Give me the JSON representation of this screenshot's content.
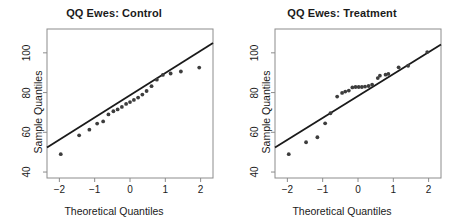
{
  "figure": {
    "background": "#ffffff",
    "foreground": "#333333",
    "frame_color": "#8c8c8c",
    "point_color": "#3d3d3d",
    "line_color": "#1a1a1a"
  },
  "panels": [
    {
      "id": "control",
      "title": "QQ Ewes: Control",
      "xlabel": "Theoretical Quantiles",
      "ylabel": "Sample Quantiles"
    },
    {
      "id": "treatment",
      "title": "QQ Ewes: Treatment",
      "xlabel": "Theoretical Quantiles",
      "ylabel": "Sample Quantiles"
    }
  ],
  "chart_data": [
    {
      "type": "scatter",
      "title": "QQ Ewes: Control",
      "xlabel": "Theoretical Quantiles",
      "ylabel": "Sample Quantiles",
      "xlim": [
        -2.35,
        2.35
      ],
      "ylim": [
        37.0,
        112.0
      ],
      "xticks": [
        -2,
        -1,
        0,
        1,
        2
      ],
      "xticklabels": [
        "-2",
        "-1",
        "0",
        "1",
        "2"
      ],
      "yticks": [
        40,
        60,
        80,
        100
      ],
      "yticklabels": [
        "40",
        "60",
        "80",
        "100"
      ],
      "grid": false,
      "legend": null,
      "x": [
        -1.96,
        -1.44,
        -1.15,
        -0.93,
        -0.76,
        -0.61,
        -0.47,
        -0.35,
        -0.23,
        -0.11,
        0.0,
        0.11,
        0.23,
        0.35,
        0.47,
        0.61,
        0.76,
        0.93,
        1.15,
        1.44,
        1.96
      ],
      "y": [
        49.0,
        58.5,
        61.3,
        64.4,
        65.5,
        69.0,
        70.6,
        71.5,
        72.8,
        74.3,
        75.2,
        76.3,
        77.5,
        79.0,
        80.8,
        83.2,
        86.5,
        88.9,
        89.6,
        90.6,
        92.6
      ],
      "reference_line": {
        "type": "qqline",
        "x": [
          -2.35,
          2.35
        ],
        "y": [
          52.4,
          104.9
        ]
      }
    },
    {
      "type": "scatter",
      "title": "QQ Ewes: Treatment",
      "xlabel": "Theoretical Quantiles",
      "ylabel": "Sample Quantiles",
      "xlim": [
        -2.35,
        2.35
      ],
      "ylim": [
        37.0,
        112.0
      ],
      "xticks": [
        -2,
        -1,
        0,
        1,
        2
      ],
      "xticklabels": [
        "-2",
        "-1",
        "0",
        "1",
        "2"
      ],
      "yticks": [
        40,
        60,
        80,
        100
      ],
      "yticklabels": [
        "40",
        "60",
        "80",
        "100"
      ],
      "grid": false,
      "legend": null,
      "x": [
        -1.96,
        -1.47,
        -1.15,
        -0.93,
        -0.78,
        -0.59,
        -0.45,
        -0.36,
        -0.26,
        -0.16,
        -0.07,
        0.02,
        0.11,
        0.2,
        0.3,
        0.4,
        0.56,
        0.62,
        0.78,
        0.86,
        1.15,
        1.42,
        1.96
      ],
      "y": [
        49.0,
        55.0,
        57.5,
        64.5,
        69.6,
        78.0,
        79.8,
        80.5,
        81.0,
        82.6,
        82.8,
        82.8,
        82.8,
        83.0,
        83.3,
        84.0,
        87.3,
        88.5,
        89.0,
        89.4,
        92.7,
        93.5,
        100.4
      ],
      "reference_line": {
        "type": "qqline",
        "x": [
          -2.35,
          2.35
        ],
        "y": [
          52.4,
          104.2
        ]
      }
    }
  ]
}
